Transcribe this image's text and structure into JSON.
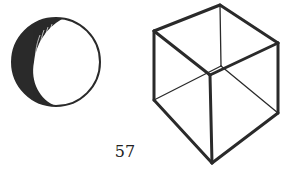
{
  "illustration": {
    "left_figure": "shaded-sphere",
    "right_figure": "wireframe-cube"
  },
  "page": {
    "number": "57"
  },
  "colors": {
    "ink": "#2a2a2a",
    "paper": "#ffffff"
  }
}
